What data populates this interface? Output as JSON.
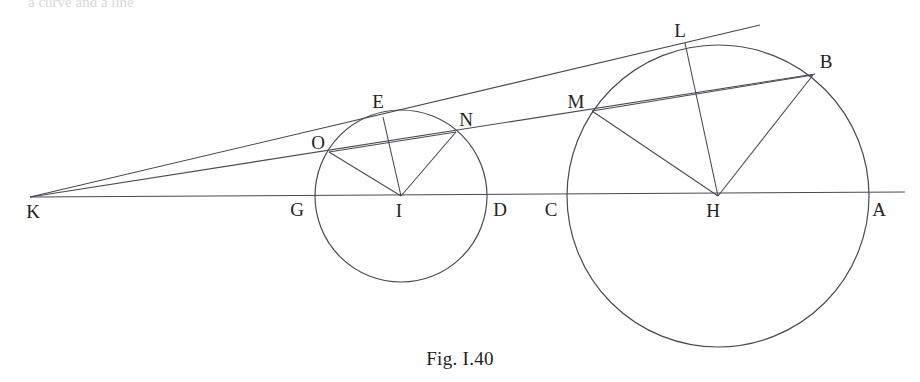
{
  "figure": {
    "caption": "Fig. I.40",
    "bleed_text_fragment": "a curve and a line",
    "width": 920,
    "height": 382,
    "background_color": "#ffffff",
    "stroke_color": "#4a4a55",
    "label_color": "#242424"
  },
  "geometry": {
    "baseline": {
      "x1": 30,
      "y1": 197,
      "x2": 905,
      "y2": 192
    },
    "circles": [
      {
        "name": "small-circle",
        "center_label": "I",
        "cx": 401,
        "cy": 196,
        "r": 86
      },
      {
        "name": "large-circle",
        "center_label": "H",
        "cx": 718,
        "cy": 196,
        "r": 151
      }
    ],
    "lines": [
      {
        "name": "tangent-line-k-e-l",
        "x1": 30,
        "y1": 197,
        "x2": 760,
        "y2": 25
      },
      {
        "name": "secant-line-k-o-n-m-b",
        "x1": 30,
        "y1": 197,
        "x2": 815,
        "y2": 74
      },
      {
        "name": "radius-i-o",
        "x1": 401,
        "y1": 196,
        "x2": 329,
        "y2": 152
      },
      {
        "name": "radius-i-e",
        "x1": 401,
        "y1": 196,
        "x2": 383,
        "y2": 117
      },
      {
        "name": "radius-i-n",
        "x1": 401,
        "y1": 196,
        "x2": 456,
        "y2": 132
      },
      {
        "name": "chord-o-n",
        "x1": 329,
        "y1": 152,
        "x2": 456,
        "y2": 132
      },
      {
        "name": "radius-h-m",
        "x1": 718,
        "y1": 196,
        "x2": 592,
        "y2": 111
      },
      {
        "name": "radius-h-l",
        "x1": 718,
        "y1": 196,
        "x2": 685,
        "y2": 43
      },
      {
        "name": "radius-h-b",
        "x1": 718,
        "y1": 196,
        "x2": 813,
        "y2": 75
      },
      {
        "name": "chord-m-b",
        "x1": 592,
        "y1": 111,
        "x2": 813,
        "y2": 75
      }
    ]
  },
  "labels": [
    {
      "id": "K",
      "text": "K",
      "x": 33,
      "y": 211
    },
    {
      "id": "G",
      "text": "G",
      "x": 297,
      "y": 209
    },
    {
      "id": "I",
      "text": "I",
      "x": 399,
      "y": 210
    },
    {
      "id": "D",
      "text": "D",
      "x": 500,
      "y": 209
    },
    {
      "id": "C",
      "text": "C",
      "x": 551,
      "y": 209
    },
    {
      "id": "H",
      "text": "H",
      "x": 713,
      "y": 210
    },
    {
      "id": "A",
      "text": "A",
      "x": 879,
      "y": 209
    },
    {
      "id": "O",
      "text": "O",
      "x": 318,
      "y": 142
    },
    {
      "id": "E",
      "text": "E",
      "x": 378,
      "y": 101
    },
    {
      "id": "N",
      "text": "N",
      "x": 466,
      "y": 119
    },
    {
      "id": "M",
      "text": "M",
      "x": 576,
      "y": 101
    },
    {
      "id": "L",
      "text": "L",
      "x": 680,
      "y": 30
    },
    {
      "id": "B",
      "text": "B",
      "x": 826,
      "y": 61
    }
  ]
}
